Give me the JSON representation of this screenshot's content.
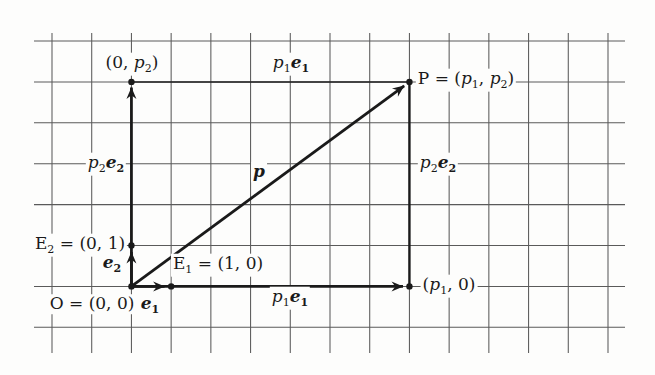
{
  "figure": {
    "colors": {
      "ink": "#1a1a1a",
      "grid_line": "#5a5a5a",
      "paper": "#fdfdfc"
    },
    "labels": {
      "y_proj": {
        "parts": [
          "(0, ",
          "p",
          "2",
          ")"
        ]
      },
      "p1e1_top": {
        "parts": [
          "p",
          "1",
          "e",
          "1"
        ]
      },
      "p_point": {
        "parts": [
          "P = (",
          "p",
          "1",
          ", ",
          "p",
          "2",
          ")"
        ]
      },
      "p2e2_left": {
        "parts": [
          "p",
          "2",
          "e",
          "2"
        ]
      },
      "p_vector": {
        "parts": [
          "p"
        ]
      },
      "p2e2_right": {
        "parts": [
          "p",
          "2",
          "e",
          "2"
        ]
      },
      "e2_point": {
        "parts": [
          "E",
          "2",
          " = (0, 1)"
        ]
      },
      "e2_vector": {
        "parts": [
          "e",
          "2"
        ]
      },
      "e1_point": {
        "parts": [
          "E",
          "1",
          " = (1, 0)"
        ]
      },
      "origin": {
        "parts": [
          "O = (0, 0)"
        ]
      },
      "e1_vector": {
        "parts": [
          "e",
          "1"
        ]
      },
      "p1e1_bottom": {
        "parts": [
          "p",
          "1",
          "e",
          "1"
        ]
      },
      "x_proj": {
        "parts": [
          "(",
          "p",
          "1",
          ", 0)"
        ]
      }
    }
  }
}
